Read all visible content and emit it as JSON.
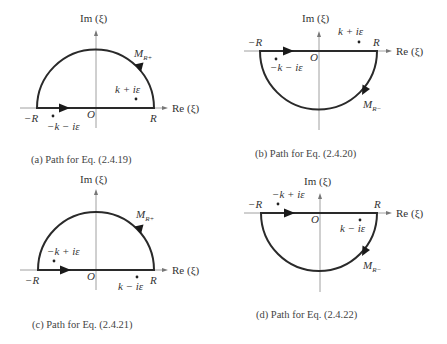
{
  "figure": {
    "axis_labels": {
      "imag": "Im (ξ)",
      "real": "Re (ξ)",
      "origin": "O",
      "minus_R": "−R",
      "plus_R": "R"
    },
    "panels": [
      {
        "id": "a",
        "caption": "(a) Path for Eq. (2.4.19)",
        "contour": "upper semicircle",
        "arc_label": "M",
        "arc_sub": "R+",
        "poles": [
          {
            "label": "k + iε",
            "position": "upper-right"
          },
          {
            "label": "−k − iε",
            "position": "lower-left"
          }
        ]
      },
      {
        "id": "b",
        "caption": "(b) Path for Eq. (2.4.20)",
        "contour": "lower semicircle",
        "arc_label": "M",
        "arc_sub": "R−",
        "poles": [
          {
            "label": "k + iε",
            "position": "upper-right"
          },
          {
            "label": "−k − iε",
            "position": "lower-left"
          }
        ]
      },
      {
        "id": "c",
        "caption": "(c) Path for Eq. (2.4.21)",
        "contour": "upper semicircle",
        "arc_label": "M",
        "arc_sub": "R+",
        "poles": [
          {
            "label": "−k + iε",
            "position": "upper-left"
          },
          {
            "label": "k − iε",
            "position": "lower-right"
          }
        ]
      },
      {
        "id": "d",
        "caption": "(d) Path for Eq. (2.4.22)",
        "contour": "lower semicircle",
        "arc_label": "M",
        "arc_sub": "R−",
        "poles": [
          {
            "label": "−k + iε",
            "position": "upper-left"
          },
          {
            "label": "k − iε",
            "position": "lower-right"
          }
        ]
      }
    ]
  }
}
